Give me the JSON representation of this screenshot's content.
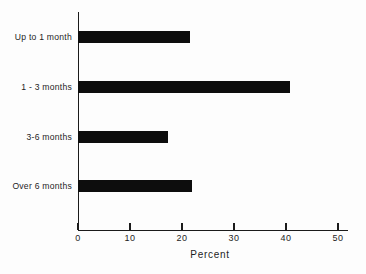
{
  "chart_data": {
    "type": "bar",
    "orientation": "horizontal",
    "title": "",
    "xlabel": "Percent",
    "ylabel": "",
    "categories": [
      "Up to 1 month",
      "1 - 3 months",
      "3-6 months",
      "Over 6 months"
    ],
    "values": [
      21.5,
      40.8,
      17.3,
      21.9
    ],
    "xlim": [
      0,
      50
    ],
    "xticks": [
      0,
      10,
      20,
      30,
      40,
      50
    ],
    "xtick_labels": [
      "0",
      "10",
      "20",
      "30",
      "40",
      "50"
    ],
    "grid": false,
    "legend": null,
    "bar_color": "#0d0d0d",
    "axis_color": "#1b1b1b",
    "background": "#fdfdfd"
  }
}
